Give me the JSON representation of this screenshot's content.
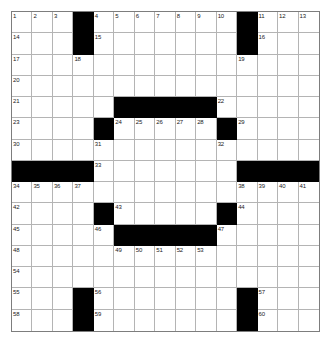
{
  "puzzle": {
    "type": "crossword-grid",
    "rows": 15,
    "cols": 15,
    "colors": {
      "background": "#ffffff",
      "cell_fill": "#ffffff",
      "block_fill": "#000000",
      "grid_line": "#b4b4b4",
      "outer_border": "#7d7d7d",
      "number_text": "#1a1a1a"
    },
    "block_cells": [
      [
        0,
        3
      ],
      [
        0,
        11
      ],
      [
        1,
        3
      ],
      [
        1,
        11
      ],
      [
        4,
        5
      ],
      [
        4,
        6
      ],
      [
        4,
        7
      ],
      [
        4,
        8
      ],
      [
        4,
        9
      ],
      [
        5,
        4
      ],
      [
        5,
        10
      ],
      [
        7,
        0
      ],
      [
        7,
        1
      ],
      [
        7,
        2
      ],
      [
        7,
        3
      ],
      [
        7,
        11
      ],
      [
        7,
        12
      ],
      [
        7,
        13
      ],
      [
        7,
        14
      ],
      [
        9,
        4
      ],
      [
        9,
        10
      ],
      [
        10,
        5
      ],
      [
        10,
        6
      ],
      [
        10,
        7
      ],
      [
        10,
        8
      ],
      [
        10,
        9
      ],
      [
        13,
        3
      ],
      [
        13,
        11
      ],
      [
        14,
        3
      ],
      [
        14,
        11
      ]
    ],
    "numbered_cells": [
      {
        "number": "1",
        "row": 0,
        "col": 0
      },
      {
        "number": "2",
        "row": 0,
        "col": 1
      },
      {
        "number": "3",
        "row": 0,
        "col": 2
      },
      {
        "number": "4",
        "row": 0,
        "col": 4
      },
      {
        "number": "5",
        "row": 0,
        "col": 5
      },
      {
        "number": "6",
        "row": 0,
        "col": 6
      },
      {
        "number": "7",
        "row": 0,
        "col": 7
      },
      {
        "number": "8",
        "row": 0,
        "col": 8
      },
      {
        "number": "9",
        "row": 0,
        "col": 9
      },
      {
        "number": "10",
        "row": 0,
        "col": 10
      },
      {
        "number": "11",
        "row": 0,
        "col": 12
      },
      {
        "number": "12",
        "row": 0,
        "col": 13
      },
      {
        "number": "13",
        "row": 0,
        "col": 14
      },
      {
        "number": "14",
        "row": 1,
        "col": 0
      },
      {
        "number": "15",
        "row": 1,
        "col": 4
      },
      {
        "number": "16",
        "row": 1,
        "col": 12
      },
      {
        "number": "17",
        "row": 2,
        "col": 0
      },
      {
        "number": "18",
        "row": 2,
        "col": 3
      },
      {
        "number": "19",
        "row": 2,
        "col": 11
      },
      {
        "number": "20",
        "row": 3,
        "col": 0
      },
      {
        "number": "21",
        "row": 4,
        "col": 0
      },
      {
        "number": "22",
        "row": 4,
        "col": 10
      },
      {
        "number": "23",
        "row": 5,
        "col": 0
      },
      {
        "number": "24",
        "row": 5,
        "col": 5
      },
      {
        "number": "25",
        "row": 5,
        "col": 6
      },
      {
        "number": "26",
        "row": 5,
        "col": 7
      },
      {
        "number": "27",
        "row": 5,
        "col": 8
      },
      {
        "number": "28",
        "row": 5,
        "col": 9
      },
      {
        "number": "29",
        "row": 5,
        "col": 11
      },
      {
        "number": "30",
        "row": 6,
        "col": 0
      },
      {
        "number": "31",
        "row": 6,
        "col": 4
      },
      {
        "number": "32",
        "row": 6,
        "col": 10
      },
      {
        "number": "33",
        "row": 7,
        "col": 4
      },
      {
        "number": "34",
        "row": 8,
        "col": 0
      },
      {
        "number": "35",
        "row": 8,
        "col": 1
      },
      {
        "number": "36",
        "row": 8,
        "col": 2
      },
      {
        "number": "37",
        "row": 8,
        "col": 3
      },
      {
        "number": "38",
        "row": 8,
        "col": 11
      },
      {
        "number": "39",
        "row": 8,
        "col": 12
      },
      {
        "number": "40",
        "row": 8,
        "col": 13
      },
      {
        "number": "41",
        "row": 8,
        "col": 14
      },
      {
        "number": "42",
        "row": 9,
        "col": 0
      },
      {
        "number": "43",
        "row": 9,
        "col": 5
      },
      {
        "number": "44",
        "row": 9,
        "col": 11
      },
      {
        "number": "45",
        "row": 10,
        "col": 0
      },
      {
        "number": "46",
        "row": 10,
        "col": 4
      },
      {
        "number": "47",
        "row": 10,
        "col": 10
      },
      {
        "number": "48",
        "row": 11,
        "col": 0
      },
      {
        "number": "49",
        "row": 11,
        "col": 5
      },
      {
        "number": "50",
        "row": 11,
        "col": 6
      },
      {
        "number": "51",
        "row": 11,
        "col": 7
      },
      {
        "number": "52",
        "row": 11,
        "col": 8
      },
      {
        "number": "53",
        "row": 11,
        "col": 9
      },
      {
        "number": "54",
        "row": 12,
        "col": 0
      },
      {
        "number": "55",
        "row": 13,
        "col": 0
      },
      {
        "number": "56",
        "row": 13,
        "col": 4
      },
      {
        "number": "57",
        "row": 13,
        "col": 12
      },
      {
        "number": "58",
        "row": 14,
        "col": 0
      },
      {
        "number": "59",
        "row": 14,
        "col": 4
      },
      {
        "number": "60",
        "row": 14,
        "col": 12
      }
    ]
  }
}
